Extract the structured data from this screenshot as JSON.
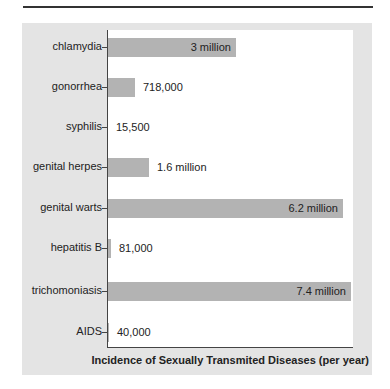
{
  "chart_data": {
    "type": "bar",
    "orientation": "horizontal",
    "title": "",
    "xlabel": "Incidence of Sexually Transmited Diseases (per year)",
    "ylabel": "",
    "categories": [
      "chlamydia",
      "gonorrhea",
      "syphilis",
      "genital herpes",
      "genital warts",
      "hepatitis B",
      "trichomoniasis",
      "AIDS"
    ],
    "values": [
      3000000,
      718000,
      15500,
      1600000,
      6200000,
      81000,
      7400000,
      40000
    ],
    "value_labels": [
      "3 million",
      "718,000",
      "15,500",
      "1.6 million",
      "6.2 million",
      "81,000",
      "7.4 million",
      "40,000"
    ],
    "xlim": [
      0,
      7400000
    ],
    "grid": false,
    "legend": null,
    "bar_color": "#b3b3b3"
  },
  "rows": [
    {
      "label": "chlamydia",
      "value_label": "3 million",
      "width": 128,
      "inside": true
    },
    {
      "label": "gonorrhea",
      "value_label": "718,000",
      "width": 27,
      "inside": false
    },
    {
      "label": "syphilis",
      "value_label": "15,500",
      "width": 0,
      "inside": false
    },
    {
      "label": "genital herpes",
      "value_label": "1.6 million",
      "width": 41,
      "inside": false
    },
    {
      "label": "genital warts",
      "value_label": "6.2 million",
      "width": 235,
      "inside": true
    },
    {
      "label": "hepatitis B",
      "value_label": "81,000",
      "width": 3,
      "inside": false
    },
    {
      "label": "trichomoniasis",
      "value_label": "7.4 million",
      "width": 243,
      "inside": true
    },
    {
      "label": "AIDS",
      "value_label": "40,000",
      "width": 1,
      "inside": false
    }
  ]
}
